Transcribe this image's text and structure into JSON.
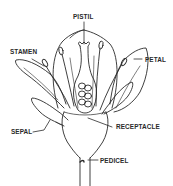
{
  "labels": {
    "pistil": "PISTIL",
    "stamen": "STAMEN",
    "petal": "PETAL",
    "sepal": "SEPAL",
    "receptacle": "RECEPTACLE",
    "pedicel": "PEDICEL"
  },
  "colors": {
    "line": "#2a2a2a",
    "background": "#ffffff"
  }
}
